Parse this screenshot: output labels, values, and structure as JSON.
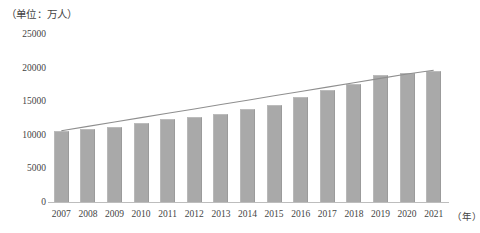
{
  "chart_data": {
    "type": "bar",
    "title": "（单位：万人）",
    "xlabel": "（年）",
    "ylabel": "",
    "unit_note": "（单位：万人）",
    "categories": [
      "2007",
      "2008",
      "2009",
      "2010",
      "2011",
      "2012",
      "2013",
      "2014",
      "2015",
      "2016",
      "2017",
      "2018",
      "2019",
      "2020",
      "2021"
    ],
    "values": [
      10600,
      10800,
      11200,
      11700,
      12300,
      12700,
      13100,
      13800,
      14400,
      15600,
      16700,
      17500,
      18900,
      19200,
      19500
    ],
    "series": [
      {
        "name": "柱状数据",
        "type": "bar",
        "values": [
          10600,
          10800,
          11200,
          11700,
          12300,
          12700,
          13100,
          13800,
          14400,
          15600,
          16700,
          17500,
          18900,
          19200,
          19500
        ]
      },
      {
        "name": "趋势线",
        "type": "line",
        "values": [
          10600,
          11250,
          11900,
          12550,
          13200,
          13850,
          14500,
          15150,
          15800,
          16450,
          17100,
          17750,
          18400,
          19050,
          19600
        ]
      }
    ],
    "ylim": [
      0,
      25000
    ],
    "ytick_values": [
      0,
      5000,
      10000,
      15000,
      20000,
      25000
    ],
    "ytick_labels": [
      "0",
      "5000",
      "10000",
      "15000",
      "20000",
      "25000"
    ],
    "grid": false,
    "legend": "none",
    "bar_color": "#a9a9a9",
    "line_color": "#8f8f8f",
    "axis_color": "#bdbdbd",
    "text_color": "#444444"
  }
}
